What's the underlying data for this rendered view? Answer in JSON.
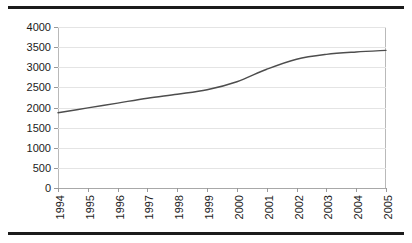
{
  "figure": {
    "background_color": "#ffffff",
    "rule_color": "#1b1b1b",
    "grid_color": "#e4e4e4",
    "axis_color": "#b9b9b9"
  },
  "chart_data": {
    "type": "line",
    "title": "",
    "subtitle": "",
    "xlabel": "",
    "ylabel": "",
    "categories": [
      "1994",
      "1995",
      "1996",
      "1997",
      "1998",
      "1999",
      "2000",
      "2001",
      "2002",
      "2003",
      "2004",
      "2005"
    ],
    "x": [
      1994,
      1995,
      1996,
      1997,
      1998,
      1999,
      2000,
      2001,
      2002,
      2003,
      2004,
      2005
    ],
    "values": [
      1870,
      1990,
      2110,
      2230,
      2330,
      2440,
      2640,
      2950,
      3200,
      3320,
      3380,
      3420
    ],
    "series": [
      {
        "name": "series-1",
        "color": "#4d4d4d",
        "line_width": 1.4,
        "values": [
          1870,
          1990,
          2110,
          2230,
          2330,
          2440,
          2640,
          2950,
          3200,
          3320,
          3380,
          3420
        ]
      }
    ],
    "ylim": [
      0,
      4000
    ],
    "yticks": [
      0,
      500,
      1000,
      1500,
      2000,
      2500,
      3000,
      3500,
      4000
    ],
    "ytick_labels": [
      "0",
      "500",
      "1000",
      "1500",
      "2000",
      "2500",
      "3000",
      "3500",
      "4000"
    ],
    "xtick_labels": [
      "1994",
      "1995",
      "1996",
      "1997",
      "1998",
      "1999",
      "2000",
      "2001",
      "2002",
      "2003",
      "2004",
      "2005"
    ],
    "xtick_rotation": 90,
    "grid": true,
    "grid_axis": "y",
    "legend": false,
    "legend_position": "none",
    "annotations": []
  }
}
